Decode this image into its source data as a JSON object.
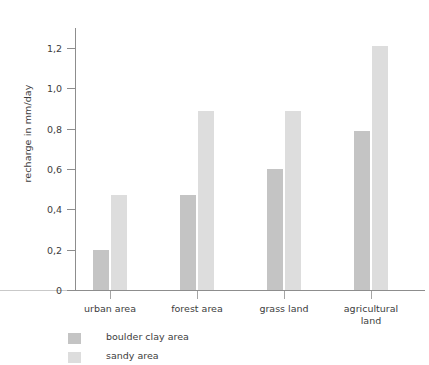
{
  "chart_data": {
    "type": "bar",
    "title": "",
    "subtitle": "",
    "xlabel": "",
    "ylabel": "recharge in mm/day",
    "ylim": [
      0,
      1.3
    ],
    "yticks": [
      0,
      0.2,
      0.4,
      0.6,
      0.8,
      1.0,
      1.2
    ],
    "ytick_labels": [
      "0",
      "0,2",
      "0,4",
      "0,6",
      "0,8",
      "1,0",
      "1,2"
    ],
    "grid": false,
    "legend_position": "below-left",
    "categories": [
      "urban area",
      "forest area",
      "grass land",
      "agricultural land"
    ],
    "category_lines": [
      [
        "urban area"
      ],
      [
        "forest area"
      ],
      [
        "grass land"
      ],
      [
        "agricultural",
        "land"
      ]
    ],
    "series": [
      {
        "name": "boulder clay area",
        "color": "#c4c4c4",
        "values": [
          0.2,
          0.47,
          0.6,
          0.79
        ]
      },
      {
        "name": "sandy area",
        "color": "#dddddd",
        "values": [
          0.47,
          0.89,
          0.89,
          1.21
        ]
      }
    ]
  },
  "axis": {
    "y_title": "recharge in mm/day"
  },
  "legend": {
    "items": [
      {
        "label": "boulder clay area",
        "swatch": "boulder"
      },
      {
        "label": "sandy area",
        "swatch": "sandy"
      }
    ]
  }
}
